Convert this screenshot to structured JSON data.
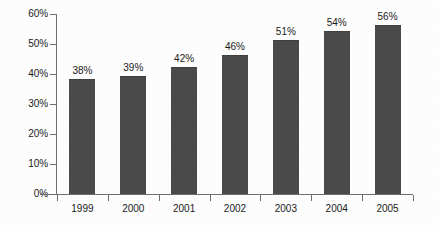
{
  "chart_data": {
    "type": "bar",
    "title": "",
    "subtitle": "",
    "xlabel": "",
    "ylabel": "",
    "categories": [
      "1999",
      "2000",
      "2001",
      "2002",
      "2003",
      "2004",
      "2005"
    ],
    "values": [
      38,
      39,
      42,
      46,
      51,
      54,
      56
    ],
    "data_labels": [
      "38%",
      "39%",
      "42%",
      "46%",
      "51%",
      "54%",
      "56%"
    ],
    "ylim": [
      0,
      60
    ],
    "ytick_values": [
      0,
      10,
      20,
      30,
      40,
      50,
      60
    ],
    "ytick_labels": [
      "0%",
      "10%",
      "20%",
      "30%",
      "40%",
      "50%",
      "60%"
    ],
    "grid": false,
    "legend": "none",
    "bar_color": "#4a4a4a",
    "axis_color": "#6e6e6e",
    "background_color": "#fdfdfd",
    "text_color": "#1a1a1a",
    "value_suffix": "%"
  }
}
